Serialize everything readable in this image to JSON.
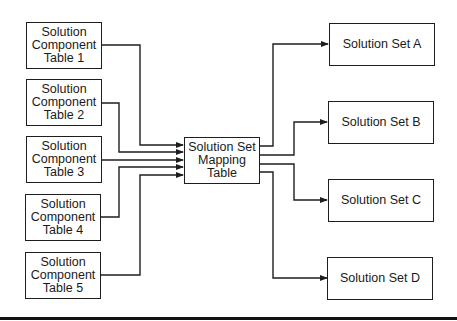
{
  "diagram": {
    "sources": [
      {
        "lines": [
          "Solution",
          "Component",
          "Table 1"
        ]
      },
      {
        "lines": [
          "Solution",
          "Component",
          "Table 2"
        ]
      },
      {
        "lines": [
          "Solution",
          "Component",
          "Table 3"
        ]
      },
      {
        "lines": [
          "Solution",
          "Component",
          "Table 4"
        ]
      },
      {
        "lines": [
          "Solution",
          "Component",
          "Table 5"
        ]
      }
    ],
    "hub": {
      "lines": [
        "Solution Set",
        "Mapping",
        "Table"
      ]
    },
    "targets": [
      {
        "label": "Solution Set A"
      },
      {
        "label": "Solution Set B"
      },
      {
        "label": "Solution Set C"
      },
      {
        "label": "Solution Set D"
      }
    ],
    "colors": {
      "stroke": "#1e1e1e",
      "background": "#ffffff",
      "rule": "#111111"
    }
  }
}
